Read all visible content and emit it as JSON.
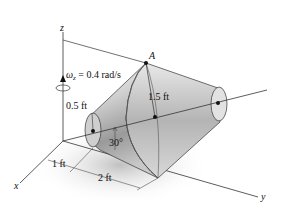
{
  "diagram": {
    "type": "rigid-body rotation figure",
    "object": "frustum (truncated cone) spinning about inclined axis",
    "axes": {
      "z_label": "z",
      "x_label": "x",
      "y_label": "y"
    },
    "point_label": "A",
    "angular_velocity": {
      "symbol": "ω",
      "subscript": "z",
      "value_text": " = 0.4 rad/s"
    },
    "dimensions": {
      "small_radius": "0.5 ft",
      "large_radius": "1.5 ft",
      "angle": "30°",
      "offset": "1 ft",
      "length": "2 ft"
    },
    "colors": {
      "line": "#333333",
      "body_light": "#e6e6e6",
      "body_dark": "#8a8a8a",
      "shadow": "#cfcfcf"
    }
  }
}
